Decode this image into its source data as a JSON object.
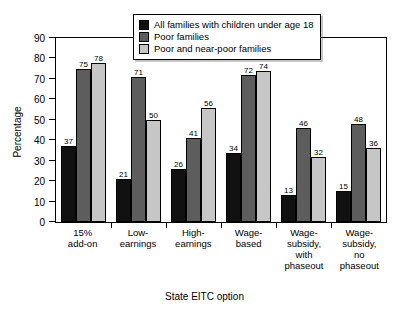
{
  "chart_data": {
    "type": "bar",
    "title": "",
    "xlabel": "State EITC option",
    "ylabel": "Percentage",
    "ylim": [
      0,
      90
    ],
    "yticks": [
      0,
      10,
      20,
      30,
      40,
      50,
      60,
      70,
      80,
      90
    ],
    "grid": false,
    "legend_position": "top-center",
    "categories": [
      "15%\nadd-on",
      "Low-\nearnings",
      "High-\nearnings",
      "Wage-\nbased",
      "Wage-\nsubsidy,\nwith\nphaseout",
      "Wage-\nsubsidy,\nno\nphaseout"
    ],
    "series": [
      {
        "name": "All families with children under age 18",
        "color": "#111111",
        "values": [
          37,
          21,
          26,
          34,
          13,
          15
        ]
      },
      {
        "name": "Poor families",
        "color": "#5d5d5d",
        "values": [
          75,
          71,
          41,
          72,
          46,
          48
        ]
      },
      {
        "name": "Poor and near-poor families",
        "color": "#c6c6c6",
        "values": [
          78,
          50,
          56,
          74,
          32,
          36
        ]
      }
    ]
  }
}
